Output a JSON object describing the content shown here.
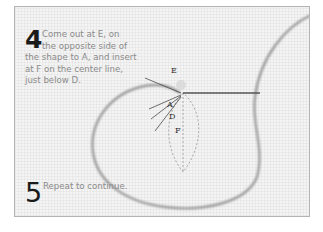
{
  "steps": [
    {
      "number": "4",
      "lines": [
        "Come out at E, on",
        "the opposite side of",
        "the shape to A, and insert",
        "at F on the center line,",
        "just below D."
      ]
    },
    {
      "number": "5",
      "lines": [
        "Repeat to continue."
      ]
    }
  ],
  "diagram": {
    "labels": {
      "E": "E",
      "A": "A",
      "D": "D",
      "F": "F"
    },
    "colors": {
      "thread": "#7a7a7a",
      "outline": "#a0a0a0",
      "leader": "#333333",
      "needle": "#555555",
      "background": "#f4f4f4",
      "border": "#b4b4b4"
    }
  }
}
